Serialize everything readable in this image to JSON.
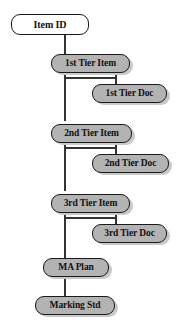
{
  "diagram": {
    "type": "flowchart",
    "colors": {
      "root_fill": "#ffffff",
      "node_fill": "#b3b3b3",
      "border": "#1a1a1a",
      "edge": "#333333",
      "shadow": "#c9c9c9",
      "text": "#111111",
      "background": "#ffffff"
    },
    "nodes": [
      {
        "id": "item-id",
        "label": "Item ID",
        "style": "white"
      },
      {
        "id": "first-tier-item",
        "label": "1st Tier Item",
        "style": "gray"
      },
      {
        "id": "first-tier-doc",
        "label": "1st Tier Doc",
        "style": "gray"
      },
      {
        "id": "second-tier-item",
        "label": "2nd Tier Item",
        "style": "gray"
      },
      {
        "id": "second-tier-doc",
        "label": "2nd Tier Doc",
        "style": "gray"
      },
      {
        "id": "third-tier-item",
        "label": "3rd Tier Item",
        "style": "gray"
      },
      {
        "id": "third-tier-doc",
        "label": "3rd Tier Doc",
        "style": "gray"
      },
      {
        "id": "ma-plan",
        "label": "MA Plan",
        "style": "gray"
      },
      {
        "id": "marking-std",
        "label": "Marking Std",
        "style": "gray"
      }
    ],
    "edges": [
      {
        "from": "item-id",
        "to": "first-tier-item"
      },
      {
        "from": "first-tier-item",
        "to": "first-tier-doc"
      },
      {
        "from": "first-tier-item",
        "to": "second-tier-item"
      },
      {
        "from": "second-tier-item",
        "to": "second-tier-doc"
      },
      {
        "from": "second-tier-item",
        "to": "third-tier-item"
      },
      {
        "from": "third-tier-item",
        "to": "third-tier-doc"
      },
      {
        "from": "third-tier-item",
        "to": "ma-plan"
      },
      {
        "from": "ma-plan",
        "to": "marking-std"
      }
    ]
  }
}
